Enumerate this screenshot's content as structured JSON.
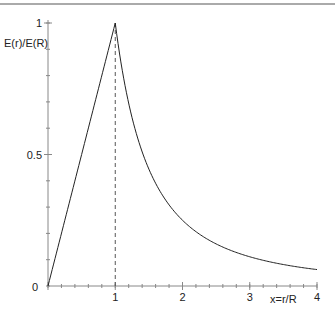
{
  "chart_data": {
    "type": "line",
    "title": "",
    "xlabel": "x=r/R",
    "ylabel": "E(r)/E(R)",
    "xlim": [
      0,
      4
    ],
    "ylim": [
      0,
      1
    ],
    "grid": false,
    "x_ticks": [
      {
        "value": 0,
        "label": "0"
      },
      {
        "value": 1,
        "label": "1"
      },
      {
        "value": 2,
        "label": "2"
      },
      {
        "value": 3,
        "label": "3"
      },
      {
        "value": 4,
        "label": "4"
      }
    ],
    "y_ticks": [
      {
        "value": 0.5,
        "label": "0.5"
      },
      {
        "value": 1,
        "label": "1"
      }
    ],
    "x_minor_step": 0.2,
    "y_minor_step": 0.1,
    "series": [
      {
        "name": "E(r)/E(R)",
        "description": "x for x<=1, 1/x^2 for x>1",
        "color": "#222222",
        "x": [
          0,
          0.25,
          0.5,
          0.75,
          1,
          1.25,
          1.5,
          1.75,
          2,
          2.25,
          2.5,
          2.75,
          3,
          3.25,
          3.5,
          3.75,
          4
        ],
        "y": [
          0,
          0.25,
          0.5,
          0.75,
          1,
          0.64,
          0.444,
          0.327,
          0.25,
          0.198,
          0.16,
          0.132,
          0.111,
          0.095,
          0.082,
          0.071,
          0.0625
        ]
      }
    ],
    "annotations": [
      {
        "type": "vertical-dashed-line",
        "x": 1,
        "y_from": 0,
        "y_to": 1
      }
    ]
  },
  "colors": {
    "axis": "#888888",
    "curve": "#222222",
    "top_rule": "#aaaaaa"
  }
}
